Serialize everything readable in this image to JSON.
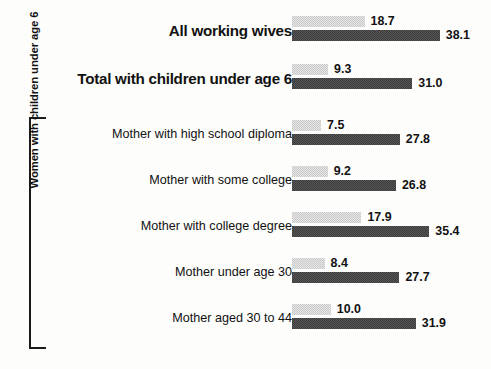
{
  "chart_data": {
    "type": "bar",
    "orientation": "horizontal",
    "title": "",
    "xlabel": "",
    "ylabel": "",
    "xlim": [
      0,
      40
    ],
    "grid": false,
    "legend_position": "none",
    "categories": [
      "All working wives",
      "Total with children under age 6",
      "Mother with high school diploma",
      "Mother with some college",
      "Mother with college degree",
      "Mother under age 30",
      "Mother aged 30 to 44"
    ],
    "series": [
      {
        "name": "light",
        "values": [
          18.7,
          9.3,
          7.5,
          9.2,
          17.9,
          8.4,
          10.0
        ]
      },
      {
        "name": "dark",
        "values": [
          38.1,
          31.0,
          27.8,
          26.8,
          35.4,
          27.7,
          31.9
        ]
      }
    ],
    "group_bracket_label": "Women with children under age 6",
    "group_bracket_rows": [
      2,
      3,
      4,
      5,
      6
    ],
    "colors": {
      "light_bar": "#c9c9c9",
      "dark_bar": "#3b3b3b",
      "text": "#111111"
    }
  },
  "rows": [
    {
      "label": "All working wives",
      "emphasis": "major",
      "light": {
        "value": "18.7",
        "num": 18.7
      },
      "dark": {
        "value": "38.1",
        "num": 38.1
      }
    },
    {
      "label": "Total with children under age 6",
      "emphasis": "major",
      "light": {
        "value": "9.3",
        "num": 9.3
      },
      "dark": {
        "value": "31.0",
        "num": 31.0
      }
    },
    {
      "label": "Mother with high school diploma",
      "emphasis": "minor",
      "light": {
        "value": "7.5",
        "num": 7.5
      },
      "dark": {
        "value": "27.8",
        "num": 27.8
      }
    },
    {
      "label": "Mother with some college",
      "emphasis": "minor",
      "light": {
        "value": "9.2",
        "num": 9.2
      },
      "dark": {
        "value": "26.8",
        "num": 26.8
      }
    },
    {
      "label": "Mother with college degree",
      "emphasis": "minor",
      "light": {
        "value": "17.9",
        "num": 17.9
      },
      "dark": {
        "value": "35.4",
        "num": 35.4
      }
    },
    {
      "label": "Mother under age 30",
      "emphasis": "minor",
      "light": {
        "value": "8.4",
        "num": 8.4
      },
      "dark": {
        "value": "27.7",
        "num": 27.7
      }
    },
    {
      "label": "Mother aged 30 to 44",
      "emphasis": "minor",
      "light": {
        "value": "10.0",
        "num": 10.0
      },
      "dark": {
        "value": "31.9",
        "num": 31.9
      }
    }
  ],
  "bracket": {
    "label": "Women with children under age 6"
  },
  "layout": {
    "row_tops": [
      8,
      56,
      112,
      158,
      204,
      250,
      296
    ],
    "bar_origin_x": 292,
    "px_per_unit": 3.88
  }
}
